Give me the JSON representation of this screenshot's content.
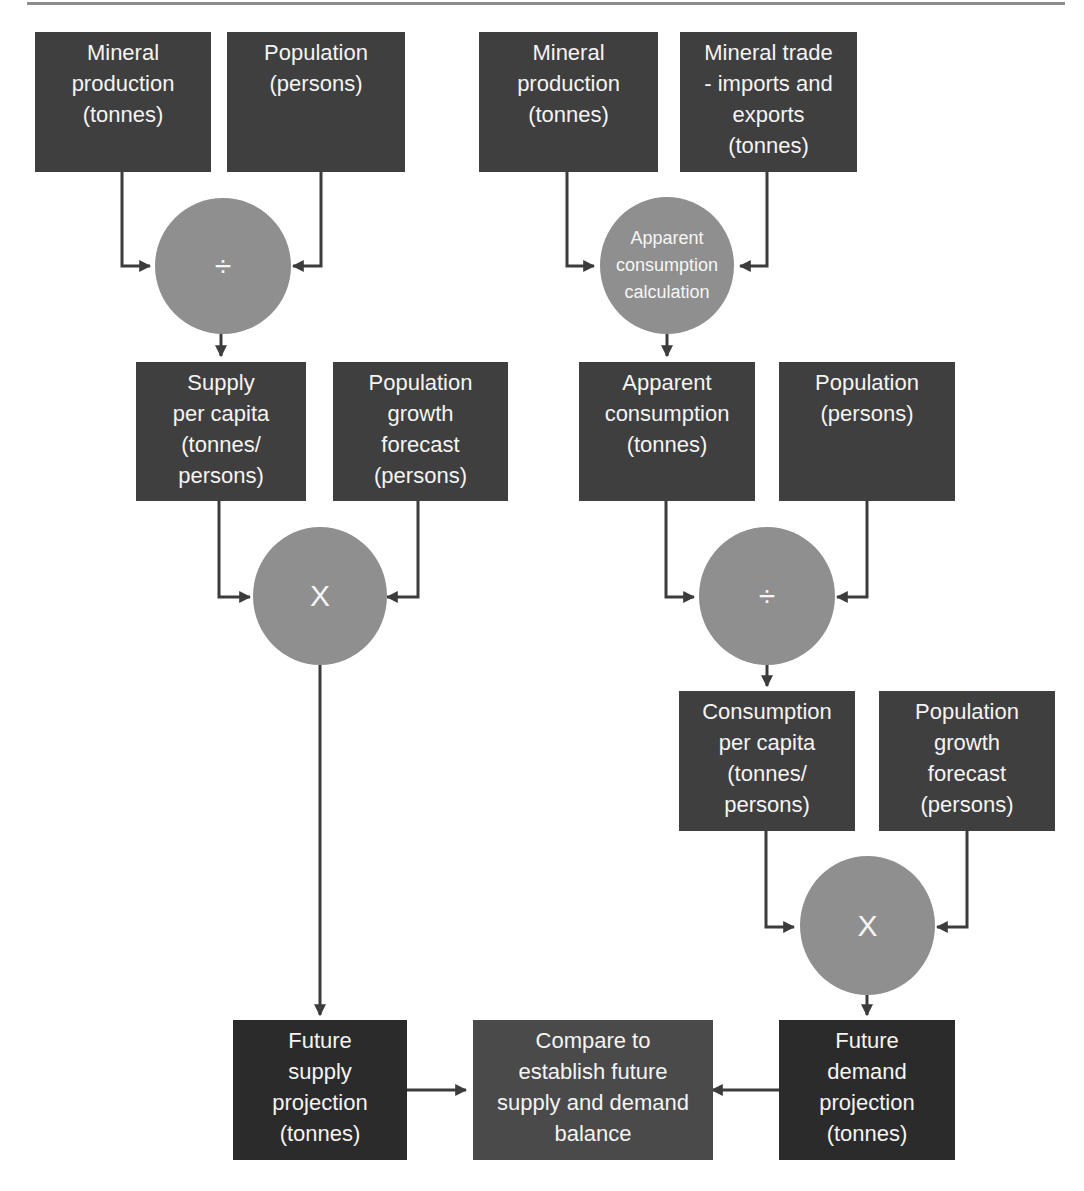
{
  "diagram": {
    "title": "",
    "colors": {
      "input_box": "#3f3f3f",
      "output_box": "#2b2b2b",
      "compare_box": "#4a4a4a",
      "operator_circle": "#8f8f8f",
      "connector": "#3c3c3c",
      "text": "#f4f4f4"
    },
    "supply_branch": {
      "mineral_production": "Mineral\nproduction\n(tonnes)",
      "population": "Population\n(persons)",
      "divide_op": "÷",
      "supply_per_capita": "Supply\nper capita\n(tonnes/\npersons)",
      "population_growth_forecast": "Population\ngrowth\nforecast\n(persons)",
      "multiply_op": "X",
      "future_supply_projection": "Future\nsupply\nprojection\n(tonnes)"
    },
    "demand_branch": {
      "mineral_production": "Mineral\nproduction\n(tonnes)",
      "mineral_trade": "Mineral trade\n- imports and\nexports\n(tonnes)",
      "apparent_consumption_calc": "Apparent\nconsumption\ncalculation",
      "apparent_consumption": "Apparent\nconsumption\n(tonnes)",
      "population": "Population\n(persons)",
      "divide_op": "÷",
      "consumption_per_capita": "Consumption\nper capita\n(tonnes/\npersons)",
      "population_growth_forecast": "Population\ngrowth\nforecast\n(persons)",
      "multiply_op": "X",
      "future_demand_projection": "Future\ndemand\nprojection\n(tonnes)"
    },
    "compare": "Compare to\nestablish future\nsupply and demand\nbalance"
  }
}
